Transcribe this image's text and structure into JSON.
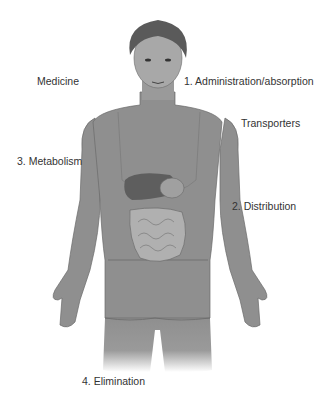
{
  "diagram": {
    "labels": {
      "medicine": "Medicine",
      "administration": "1. Administration/absorption",
      "transporters": "Transporters",
      "metabolism": "3. Metabolism",
      "distribution": "2. Distribution",
      "elimination": "4. Elimination"
    },
    "colors": {
      "body": "#8f8f8f",
      "skin_light": "#a8a8a8",
      "outline": "#6a6a6a",
      "hair": "#5a5a5a",
      "liver": "#5e5e5e",
      "arrow": "#1a1a1a",
      "text": "#333333"
    }
  }
}
